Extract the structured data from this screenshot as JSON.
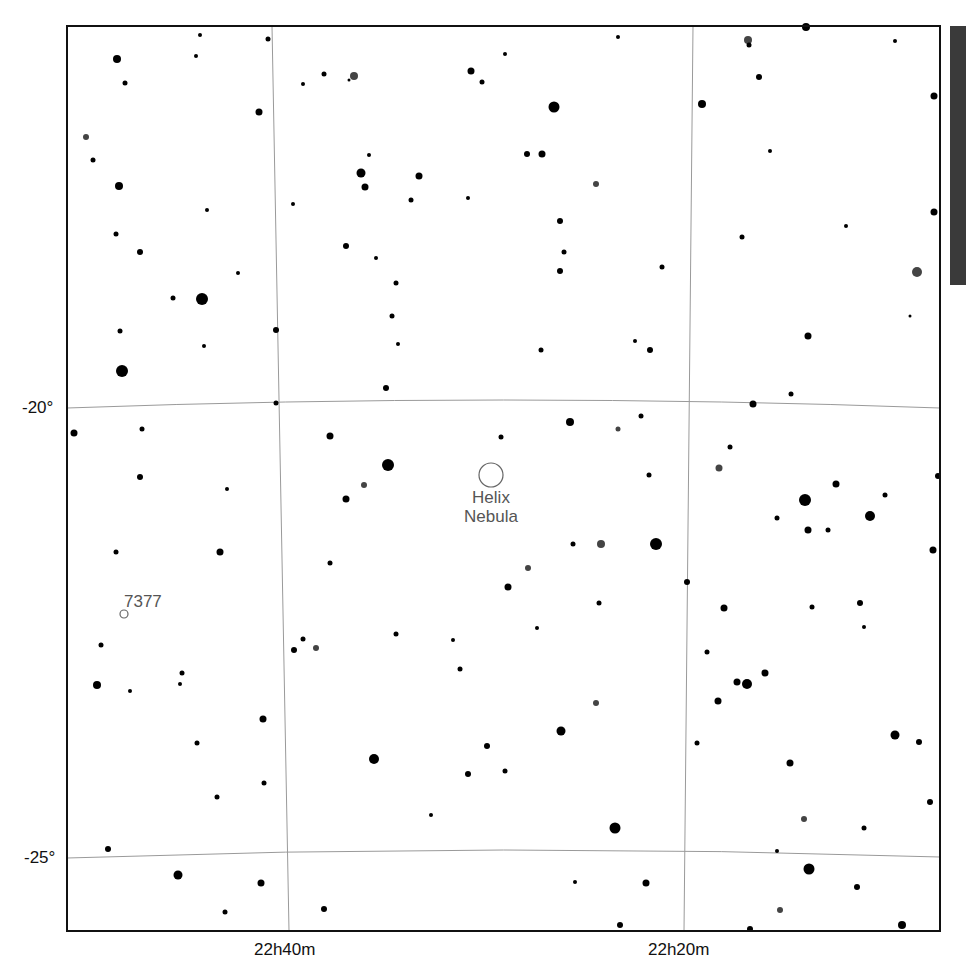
{
  "map": {
    "frame": {
      "left": 67,
      "top": 26,
      "right": 940,
      "bottom": 931
    },
    "colors": {
      "background": "#ffffff",
      "frame": "#111111",
      "grid": "#9a9a9a",
      "star": "#000000",
      "star_gray": "#444444",
      "label": "#555555",
      "sidebar": "#3a3a3a"
    },
    "dec_labels": [
      {
        "text": "-20°",
        "x": 22,
        "y": 398
      },
      {
        "text": "-25°",
        "x": 24,
        "y": 848
      }
    ],
    "ra_labels": [
      {
        "text": "22h40m",
        "x": 254,
        "y": 940
      },
      {
        "text": "22h20m",
        "x": 648,
        "y": 940
      }
    ],
    "grid": {
      "ra_lines": [
        {
          "label": "22h40m",
          "x_top": 272,
          "x_bottom": 289
        },
        {
          "label": "22h20m",
          "x_top": 693,
          "x_bottom": 684
        }
      ],
      "dec_lines": [
        {
          "label": "-20°",
          "y_left": 408,
          "y_mid": 400,
          "y_right": 408
        },
        {
          "label": "-25°",
          "y_left": 858,
          "y_mid": 850,
          "y_right": 857
        }
      ]
    },
    "objects": [
      {
        "name": "Helix Nebula",
        "lines": [
          "Helix",
          "Nebula"
        ],
        "type": "planetary-nebula",
        "x": 491,
        "y": 475,
        "r": 12,
        "label_x": 491,
        "label_y": 488,
        "font_size": 17
      },
      {
        "name": "7377",
        "lines": [
          "7377"
        ],
        "type": "galaxy",
        "x": 124,
        "y": 614,
        "r": 4,
        "label_x": 126,
        "label_y": 592,
        "font_size": 17
      }
    ],
    "stars": [
      [
        117,
        59,
        4
      ],
      [
        200,
        35,
        2
      ],
      [
        268,
        39,
        2.5
      ],
      [
        125,
        83,
        2.5
      ],
      [
        196,
        56,
        2
      ],
      [
        259,
        112,
        3.5
      ],
      [
        86,
        137,
        3,
        "g"
      ],
      [
        93,
        160,
        2.5
      ],
      [
        119,
        186,
        4
      ],
      [
        207,
        210,
        2
      ],
      [
        116,
        234,
        2.5
      ],
      [
        140,
        252,
        3
      ],
      [
        173,
        298,
        2.5
      ],
      [
        202,
        299,
        6
      ],
      [
        238,
        273,
        2
      ],
      [
        276,
        330,
        3
      ],
      [
        120,
        331,
        2.5
      ],
      [
        204,
        346,
        2
      ],
      [
        122,
        371,
        6
      ],
      [
        303,
        84,
        2
      ],
      [
        324,
        74,
        2.5
      ],
      [
        354,
        76,
        4,
        "g"
      ],
      [
        349,
        80,
        1.5
      ],
      [
        471,
        71,
        3.5
      ],
      [
        482,
        82,
        2.5
      ],
      [
        505,
        54,
        2
      ],
      [
        554,
        107,
        5.5
      ],
      [
        618,
        37,
        2
      ],
      [
        369,
        155,
        2
      ],
      [
        361,
        173,
        4.5
      ],
      [
        365,
        187,
        3.5
      ],
      [
        419,
        176,
        3.5
      ],
      [
        411,
        200,
        2.5
      ],
      [
        468,
        198,
        2
      ],
      [
        542,
        154,
        3.5
      ],
      [
        527,
        154,
        3
      ],
      [
        560,
        221,
        3
      ],
      [
        564,
        252,
        2.5
      ],
      [
        560,
        271,
        3
      ],
      [
        596,
        184,
        3,
        "g"
      ],
      [
        293,
        204,
        2
      ],
      [
        346,
        246,
        3
      ],
      [
        376,
        258,
        2
      ],
      [
        396,
        283,
        2.5
      ],
      [
        392,
        316,
        2.5
      ],
      [
        398,
        344,
        2
      ],
      [
        386,
        388,
        3
      ],
      [
        541,
        350,
        2.5
      ],
      [
        635,
        341,
        2
      ],
      [
        650,
        350,
        3
      ],
      [
        662,
        267,
        2.5
      ],
      [
        748,
        40,
        4,
        "g"
      ],
      [
        749,
        45,
        2.5
      ],
      [
        806,
        27,
        4
      ],
      [
        895,
        41,
        2
      ],
      [
        759,
        77,
        3
      ],
      [
        702,
        104,
        4
      ],
      [
        934,
        96,
        3.5
      ],
      [
        770,
        151,
        2
      ],
      [
        846,
        226,
        2
      ],
      [
        742,
        237,
        2.5
      ],
      [
        934,
        212,
        3.5
      ],
      [
        917,
        272,
        5,
        "g"
      ],
      [
        910,
        316,
        1.5
      ],
      [
        808,
        336,
        3.5
      ],
      [
        74,
        433,
        3.5
      ],
      [
        142,
        429,
        2.5
      ],
      [
        140,
        477,
        3
      ],
      [
        227,
        489,
        2
      ],
      [
        220,
        552,
        3.5
      ],
      [
        116,
        552,
        2.5
      ],
      [
        276,
        403,
        2.5
      ],
      [
        330,
        436,
        3.5
      ],
      [
        388,
        465,
        6
      ],
      [
        364,
        485,
        3,
        "g"
      ],
      [
        346,
        499,
        3.5
      ],
      [
        330,
        563,
        2.5
      ],
      [
        501,
        437,
        2.5
      ],
      [
        570,
        422,
        4
      ],
      [
        618,
        429,
        2.5,
        "g"
      ],
      [
        641,
        416,
        2.5
      ],
      [
        649,
        475,
        2.5
      ],
      [
        573,
        544,
        2.5
      ],
      [
        601,
        544,
        4,
        "g"
      ],
      [
        656,
        544,
        6
      ],
      [
        528,
        568,
        3,
        "g"
      ],
      [
        508,
        587,
        3.5
      ],
      [
        599,
        603,
        2.5
      ],
      [
        687,
        582,
        3
      ],
      [
        753,
        404,
        3.5
      ],
      [
        791,
        394,
        2.5
      ],
      [
        730,
        447,
        2.5
      ],
      [
        719,
        468,
        3.5,
        "g"
      ],
      [
        805,
        500,
        6
      ],
      [
        836,
        484,
        3.5
      ],
      [
        885,
        495,
        2.5
      ],
      [
        870,
        516,
        5
      ],
      [
        777,
        518,
        2.5
      ],
      [
        808,
        530,
        3.5
      ],
      [
        828,
        530,
        2.5
      ],
      [
        933,
        550,
        3.5
      ],
      [
        938,
        476,
        3
      ],
      [
        724,
        608,
        3.5
      ],
      [
        812,
        607,
        2.5
      ],
      [
        860,
        603,
        3
      ],
      [
        864,
        627,
        2
      ],
      [
        101,
        645,
        2.5
      ],
      [
        97,
        685,
        4
      ],
      [
        130,
        691,
        2
      ],
      [
        182,
        673,
        2.5
      ],
      [
        180,
        684,
        2
      ],
      [
        263,
        719,
        3.5
      ],
      [
        197,
        743,
        2.5
      ],
      [
        264,
        783,
        2.5
      ],
      [
        217,
        797,
        2.5
      ],
      [
        294,
        650,
        3
      ],
      [
        303,
        639,
        2.5
      ],
      [
        316,
        648,
        3,
        "g"
      ],
      [
        396,
        634,
        2.5
      ],
      [
        453,
        640,
        2
      ],
      [
        460,
        669,
        2.5
      ],
      [
        537,
        628,
        2
      ],
      [
        596,
        703,
        3,
        "g"
      ],
      [
        561,
        731,
        4.5
      ],
      [
        487,
        746,
        3
      ],
      [
        505,
        771,
        2.5
      ],
      [
        468,
        774,
        3
      ],
      [
        374,
        759,
        5
      ],
      [
        431,
        815,
        2
      ],
      [
        615,
        828,
        5.5
      ],
      [
        707,
        652,
        2.5
      ],
      [
        718,
        701,
        3.5
      ],
      [
        737,
        682,
        3.5
      ],
      [
        747,
        684,
        5
      ],
      [
        765,
        673,
        3.5
      ],
      [
        697,
        743,
        2.5
      ],
      [
        790,
        763,
        3.5
      ],
      [
        895,
        735,
        4.5
      ],
      [
        919,
        742,
        3
      ],
      [
        930,
        802,
        3
      ],
      [
        804,
        819,
        3,
        "g"
      ],
      [
        864,
        828,
        2.5
      ],
      [
        809,
        869,
        5.5
      ],
      [
        777,
        851,
        2
      ],
      [
        857,
        887,
        3
      ],
      [
        780,
        910,
        3,
        "g"
      ],
      [
        902,
        925,
        4
      ],
      [
        108,
        849,
        3
      ],
      [
        178,
        875,
        4.5
      ],
      [
        261,
        883,
        3.5
      ],
      [
        225,
        912,
        2.5
      ],
      [
        324,
        909,
        3
      ],
      [
        575,
        882,
        2
      ],
      [
        646,
        883,
        3.5
      ],
      [
        620,
        925,
        3
      ],
      [
        750,
        929,
        3
      ]
    ]
  }
}
